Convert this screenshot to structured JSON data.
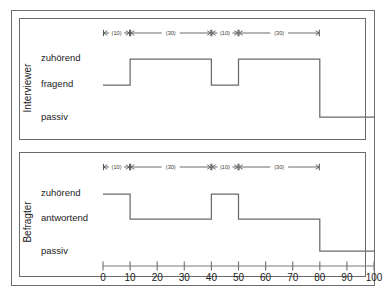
{
  "figure": {
    "background": "#ffffff",
    "line_color": "#6a6a6a",
    "frame_color": "#6e6e6e"
  },
  "panels": [
    {
      "title": "Interviewer",
      "state_labels": [
        "zuhörend",
        "fragend",
        "passiv"
      ],
      "annotations": [
        {
          "label": "(10)",
          "from": 0,
          "to": 10
        },
        {
          "label": "(30)",
          "from": 10,
          "to": 40
        },
        {
          "label": "(10)",
          "from": 40,
          "to": 50
        },
        {
          "label": "(30)",
          "from": 50,
          "to": 80
        }
      ]
    },
    {
      "title": "Befragter",
      "state_labels": [
        "zuhörend",
        "antwortend",
        "passiv"
      ],
      "annotations": [
        {
          "label": "(10)",
          "from": 0,
          "to": 10
        },
        {
          "label": "(30)",
          "from": 10,
          "to": 40
        },
        {
          "label": "(10)",
          "from": 40,
          "to": 50
        },
        {
          "label": "(30)",
          "from": 50,
          "to": 80
        }
      ]
    }
  ],
  "axis": {
    "tick_labels": [
      "0",
      "10",
      "20",
      "30",
      "40",
      "50",
      "60",
      "70",
      "80",
      "90",
      "100"
    ],
    "min": 0,
    "max": 100,
    "step": 10
  },
  "chart_data": {
    "type": "line",
    "title": "",
    "subtitle": "",
    "xlabel": "",
    "ylabel": "",
    "xlim": [
      0,
      100
    ],
    "grid": false,
    "legend": "none",
    "x_ticks": [
      0,
      10,
      20,
      30,
      40,
      50,
      60,
      70,
      80,
      90,
      100
    ],
    "x_tick_labels": [
      "0",
      "10",
      "20",
      "30",
      "40",
      "50",
      "60",
      "70",
      "80",
      "90",
      "100"
    ],
    "series": [
      {
        "name": "Interviewer",
        "type": "step",
        "categories": [
          "zuhörend",
          "fragend",
          "passiv"
        ],
        "segments": [
          {
            "from": 0,
            "to": 10,
            "state": "fragend"
          },
          {
            "from": 10,
            "to": 40,
            "state": "zuhörend"
          },
          {
            "from": 40,
            "to": 50,
            "state": "fragend"
          },
          {
            "from": 50,
            "to": 80,
            "state": "zuhörend"
          },
          {
            "from": 80,
            "to": 100,
            "state": "passiv"
          }
        ]
      },
      {
        "name": "Befragter",
        "type": "step",
        "categories": [
          "zuhörend",
          "antwortend",
          "passiv"
        ],
        "segments": [
          {
            "from": 0,
            "to": 10,
            "state": "zuhörend"
          },
          {
            "from": 10,
            "to": 40,
            "state": "antwortend"
          },
          {
            "from": 40,
            "to": 50,
            "state": "zuhörend"
          },
          {
            "from": 50,
            "to": 80,
            "state": "antwortend"
          },
          {
            "from": 80,
            "to": 100,
            "state": "passiv"
          }
        ]
      }
    ],
    "annotations": [
      {
        "label": "(10)",
        "from": 0,
        "to": 10
      },
      {
        "label": "(30)",
        "from": 10,
        "to": 40
      },
      {
        "label": "(10)",
        "from": 40,
        "to": 50
      },
      {
        "label": "(30)",
        "from": 50,
        "to": 80
      }
    ]
  }
}
